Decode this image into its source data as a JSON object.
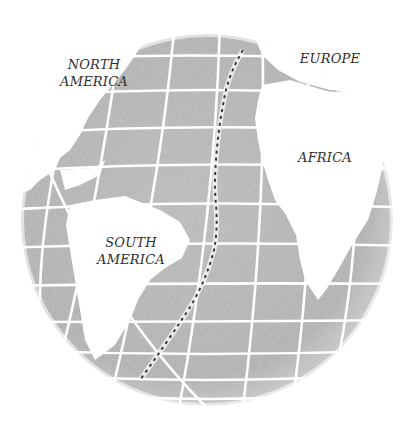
{
  "figure": {
    "colors": {
      "background": "#ffffff",
      "ocean": "#b3b3b3",
      "ocean_dark": "#9c9c9c",
      "land": "#ffffff",
      "graticule": "#ffffff",
      "ridge": "#3a3a3a",
      "label": "#2e2e2e"
    },
    "globe": {
      "cx": 207,
      "cy": 220,
      "r": 186
    }
  },
  "labels": {
    "north_america": {
      "line1": "NORTH",
      "line2": "AMERICA"
    },
    "europe": {
      "line1": "EUROPE"
    },
    "africa": {
      "line1": "AFRICA"
    },
    "south_america": {
      "line1": "SOUTH",
      "line2": "AMERICA"
    }
  },
  "features": {
    "ridge": {
      "name": "Mid-Atlantic Ridge",
      "style": "dashed"
    }
  }
}
